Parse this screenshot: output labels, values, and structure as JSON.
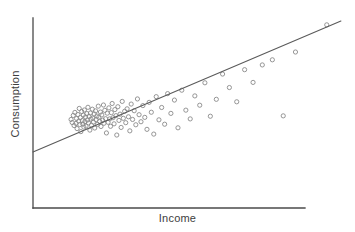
{
  "chart_data": {
    "type": "scatter",
    "title": "",
    "xlabel": "Income",
    "ylabel": "Consumption",
    "grid": false,
    "legend": false,
    "tick_labels": {
      "x": [],
      "y": []
    },
    "axis_style": "bare-axes-no-ticks",
    "xlim": [
      0,
      100
    ],
    "ylim": [
      0,
      100
    ],
    "marker": {
      "shape": "open-circle",
      "radius_px": 2.1,
      "stroke": "#8a8a8a",
      "fill": "none"
    },
    "trend_line": {
      "label": "regression line",
      "stroke": "#5a5a5a",
      "x_start": 0.0,
      "y_start": 29.5,
      "x_end": 113.2,
      "y_end": 98.4
    },
    "n_points": 115,
    "points": [
      [
        14.0,
        46.6
      ],
      [
        14.4,
        45.0
      ],
      [
        14.8,
        48.7
      ],
      [
        15.1,
        43.4
      ],
      [
        15.4,
        50.3
      ],
      [
        15.8,
        44.5
      ],
      [
        16.0,
        47.1
      ],
      [
        16.2,
        41.8
      ],
      [
        16.5,
        49.2
      ],
      [
        16.8,
        45.8
      ],
      [
        17.0,
        52.4
      ],
      [
        17.2,
        43.9
      ],
      [
        17.4,
        47.6
      ],
      [
        17.6,
        40.2
      ],
      [
        17.9,
        50.8
      ],
      [
        18.1,
        46.0
      ],
      [
        18.3,
        44.2
      ],
      [
        18.5,
        48.9
      ],
      [
        18.7,
        42.6
      ],
      [
        18.9,
        51.6
      ],
      [
        19.1,
        45.5
      ],
      [
        19.3,
        47.9
      ],
      [
        19.5,
        43.1
      ],
      [
        19.8,
        49.7
      ],
      [
        20.0,
        46.3
      ],
      [
        20.2,
        53.0
      ],
      [
        20.4,
        44.8
      ],
      [
        20.6,
        48.2
      ],
      [
        20.9,
        41.0
      ],
      [
        21.1,
        50.0
      ],
      [
        21.3,
        46.8
      ],
      [
        21.5,
        43.6
      ],
      [
        21.8,
        52.0
      ],
      [
        22.0,
        47.3
      ],
      [
        22.2,
        45.2
      ],
      [
        22.5,
        49.5
      ],
      [
        22.7,
        42.1
      ],
      [
        23.0,
        51.1
      ],
      [
        23.2,
        46.5
      ],
      [
        23.5,
        48.4
      ],
      [
        23.7,
        44.0
      ],
      [
        24.0,
        53.6
      ],
      [
        24.2,
        47.8
      ],
      [
        24.5,
        45.6
      ],
      [
        24.8,
        50.5
      ],
      [
        25.0,
        42.9
      ],
      [
        25.3,
        49.0
      ],
      [
        25.6,
        46.2
      ],
      [
        25.9,
        54.2
      ],
      [
        26.1,
        44.6
      ],
      [
        26.4,
        51.4
      ],
      [
        26.7,
        47.0
      ],
      [
        27.0,
        39.5
      ],
      [
        27.3,
        49.9
      ],
      [
        27.6,
        45.1
      ],
      [
        27.9,
        52.7
      ],
      [
        28.2,
        46.9
      ],
      [
        28.5,
        43.0
      ],
      [
        28.8,
        50.2
      ],
      [
        29.1,
        55.0
      ],
      [
        29.4,
        47.5
      ],
      [
        29.8,
        44.3
      ],
      [
        30.1,
        51.8
      ],
      [
        30.5,
        48.6
      ],
      [
        30.8,
        38.4
      ],
      [
        31.2,
        53.3
      ],
      [
        31.6,
        46.1
      ],
      [
        32.0,
        49.4
      ],
      [
        32.4,
        42.4
      ],
      [
        32.8,
        56.1
      ],
      [
        33.2,
        47.2
      ],
      [
        33.7,
        50.9
      ],
      [
        34.1,
        44.9
      ],
      [
        34.6,
        52.2
      ],
      [
        35.1,
        48.0
      ],
      [
        35.6,
        40.6
      ],
      [
        36.1,
        54.7
      ],
      [
        36.6,
        46.6
      ],
      [
        37.2,
        51.2
      ],
      [
        37.8,
        43.8
      ],
      [
        38.4,
        57.4
      ],
      [
        39.0,
        49.1
      ],
      [
        39.7,
        45.4
      ],
      [
        40.4,
        53.9
      ],
      [
        41.1,
        47.7
      ],
      [
        41.9,
        41.4
      ],
      [
        42.7,
        55.6
      ],
      [
        43.5,
        50.4
      ],
      [
        44.4,
        38.9
      ],
      [
        45.3,
        58.6
      ],
      [
        46.3,
        46.4
      ],
      [
        47.3,
        52.9
      ],
      [
        48.4,
        44.1
      ],
      [
        49.5,
        60.2
      ],
      [
        50.7,
        49.8
      ],
      [
        52.0,
        56.8
      ],
      [
        53.3,
        42.2
      ],
      [
        54.7,
        62.0
      ],
      [
        56.2,
        51.5
      ],
      [
        57.8,
        46.9
      ],
      [
        59.5,
        59.0
      ],
      [
        61.3,
        54.1
      ],
      [
        63.2,
        65.9
      ],
      [
        65.2,
        48.3
      ],
      [
        67.4,
        57.2
      ],
      [
        69.7,
        70.5
      ],
      [
        72.2,
        63.4
      ],
      [
        74.9,
        55.9
      ],
      [
        77.8,
        72.8
      ],
      [
        80.9,
        66.1
      ],
      [
        84.3,
        75.3
      ],
      [
        88.0,
        78.0
      ],
      [
        92.0,
        48.5
      ],
      [
        96.5,
        82.1
      ],
      [
        108.0,
        96.4
      ]
    ]
  },
  "axes": {
    "x_axis_name": "x-axis",
    "y_axis_name": "y-axis"
  }
}
